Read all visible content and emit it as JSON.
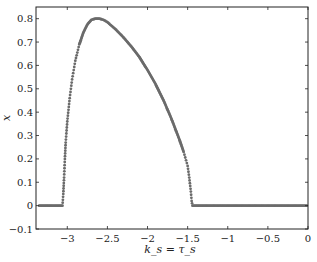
{
  "chart_data": {
    "type": "scatter",
    "title": "",
    "xlabel": "k_s = τ_s",
    "ylabel": "x",
    "xlim": [
      -3.39,
      0
    ],
    "ylim": [
      -0.1,
      0.85
    ],
    "xticks": [
      -3,
      -2.5,
      -2,
      -1.5,
      -1,
      -0.5,
      0
    ],
    "xtick_labels": [
      "−3",
      "−2.5",
      "−2",
      "−1.5",
      "−1",
      "−0.5",
      "0"
    ],
    "yticks": [
      -0.1,
      0,
      0.1,
      0.2,
      0.3,
      0.4,
      0.5,
      0.6,
      0.7,
      0.8
    ],
    "ytick_labels": [
      "−0.1",
      "0",
      "0.1",
      "0.2",
      "0.3",
      "0.4",
      "0.5",
      "0.6",
      "0.7",
      "0.8"
    ],
    "grid": false,
    "marker_color": "#6b6b6b",
    "series": [
      {
        "name": "x",
        "x": [
          -3.35,
          -3.2,
          -3.1,
          -3.06,
          -3.05,
          -3.04,
          -3.03,
          -3.02,
          -3.0,
          -2.97,
          -2.94,
          -2.9,
          -2.85,
          -2.8,
          -2.75,
          -2.7,
          -2.65,
          -2.6,
          -2.55,
          -2.5,
          -2.4,
          -2.3,
          -2.2,
          -2.1,
          -2.0,
          -1.9,
          -1.8,
          -1.7,
          -1.6,
          -1.55,
          -1.5,
          -1.48,
          -1.46,
          -1.45,
          -1.44,
          -1.3,
          -1.0,
          -0.5,
          0
        ],
        "y": [
          0,
          0,
          0,
          0.0,
          0.05,
          0.12,
          0.2,
          0.27,
          0.36,
          0.46,
          0.54,
          0.62,
          0.69,
          0.74,
          0.775,
          0.795,
          0.8,
          0.8,
          0.795,
          0.785,
          0.755,
          0.72,
          0.68,
          0.635,
          0.58,
          0.52,
          0.45,
          0.37,
          0.28,
          0.23,
          0.17,
          0.12,
          0.06,
          0.02,
          0,
          0,
          0,
          0,
          0
        ]
      }
    ]
  }
}
